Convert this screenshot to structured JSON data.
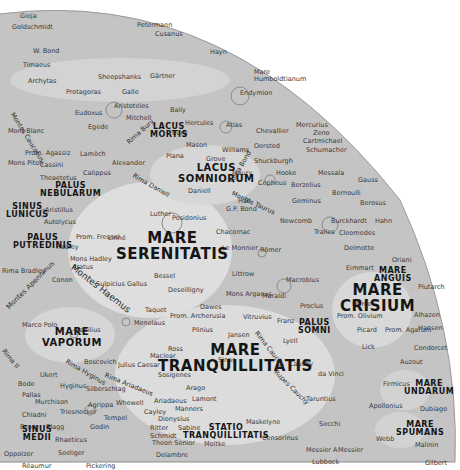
{
  "map": {
    "background": "#ffffff",
    "surface_color": "#c9c9c9",
    "mare_color": "#dcdcdc",
    "maria": [
      {
        "id": "lacus-mortis",
        "lines": [
          "LACUS",
          "MORTIS"
        ],
        "x": 150,
        "y": 123,
        "size": "m-sm"
      },
      {
        "id": "lacus-somniorum",
        "lines": [
          "LACUS",
          "SOMNIORUM"
        ],
        "x": 178,
        "y": 163,
        "size": "m-md"
      },
      {
        "id": "palus-nebularum",
        "lines": [
          "PALUS",
          "NEBULARUM"
        ],
        "x": 40,
        "y": 182,
        "size": "m-sm"
      },
      {
        "id": "sinus-lunicus",
        "lines": [
          "SINUS",
          "LUNICUS"
        ],
        "x": 6,
        "y": 203,
        "size": "m-sm"
      },
      {
        "id": "palus-putredinis",
        "lines": [
          "PALUS",
          "PUTREDINIS"
        ],
        "x": 13,
        "y": 234,
        "size": "m-sm"
      },
      {
        "id": "mare-serenitatis",
        "lines": [
          "MARE",
          "SERENITATIS"
        ],
        "x": 116,
        "y": 231,
        "size": "m-lg"
      },
      {
        "id": "mare-vaporum",
        "lines": [
          "MARE",
          "VAPORUM"
        ],
        "x": 42,
        "y": 327,
        "size": "m-md"
      },
      {
        "id": "mare-tranquillitatis",
        "lines": [
          "MARE",
          "TRANQUILLITATIS"
        ],
        "x": 158,
        "y": 343,
        "size": "m-lg"
      },
      {
        "id": "palus-somni",
        "lines": [
          "PALUS",
          "SOMNI"
        ],
        "x": 298,
        "y": 319,
        "size": "m-sm"
      },
      {
        "id": "mare-crisium",
        "lines": [
          "MARE",
          "CRISIUM"
        ],
        "x": 340,
        "y": 283,
        "size": "m-lg"
      },
      {
        "id": "mare-anguis",
        "lines": [
          "MARE",
          "ANGUIS"
        ],
        "x": 374,
        "y": 267,
        "size": "m-sm"
      },
      {
        "id": "mare-undarum",
        "lines": [
          "MARE",
          "UNDARUM"
        ],
        "x": 404,
        "y": 380,
        "size": "m-sm"
      },
      {
        "id": "mare-spumans",
        "lines": [
          "MARE",
          "SPUMANS"
        ],
        "x": 396,
        "y": 421,
        "size": "m-sm"
      },
      {
        "id": "statio-tranquillitatis",
        "lines": [
          "STATIO",
          "TRANQUILLITATIS"
        ],
        "x": 183,
        "y": 424,
        "size": "m-sm"
      },
      {
        "id": "sinus-medii",
        "lines": [
          "SINUS",
          "MEDII"
        ],
        "x": 22,
        "y": 426,
        "size": "m-sm"
      },
      {
        "id": "mare-humboldtianum",
        "lines": [
          "Mare",
          "Humboldtianum"
        ],
        "x": 254,
        "y": 69,
        "size": "plain"
      }
    ],
    "rotated_features": [
      {
        "id": "montes-haemus",
        "text": "Montes Haemus",
        "x": 72,
        "y": 262,
        "angle": 38,
        "size": 9
      },
      {
        "id": "montes-apenninus",
        "text": "Montes Apenninus",
        "x": 8,
        "y": 305,
        "angle": -45,
        "size": 7
      },
      {
        "id": "montes-caucasus",
        "text": "Montes Caucasus",
        "x": 12,
        "y": 110,
        "angle": 58,
        "size": 6.5
      },
      {
        "id": "rima-bury",
        "text": "Rima Bury",
        "x": 128,
        "y": 140,
        "angle": -42,
        "size": 6.5
      },
      {
        "id": "rima-daniell",
        "text": "Rima Daniell",
        "x": 133,
        "y": 172,
        "angle": 30,
        "size": 6.5
      },
      {
        "id": "rima-hyginus",
        "text": "Rima Hyginus",
        "x": 66,
        "y": 358,
        "angle": 30,
        "size": 6.5
      },
      {
        "id": "rima-ariadaeus",
        "text": "Rima Ariadaeus",
        "x": 105,
        "y": 372,
        "angle": 22,
        "size": 6.5
      },
      {
        "id": "rima-cauchy",
        "text": "Rima Cauchy",
        "x": 256,
        "y": 329,
        "angle": 52,
        "size": 6.5
      },
      {
        "id": "rupes-cauchy",
        "text": "Rupes Cauchy",
        "x": 275,
        "y": 368,
        "angle": 45,
        "size": 6.5
      },
      {
        "id": "montes-taurus",
        "text": "Montes Taurus",
        "x": 232,
        "y": 190,
        "angle": 25,
        "size": 6.5
      },
      {
        "id": "rima-bond",
        "text": "Rima Bond",
        "x": 232,
        "y": 179,
        "angle": -60,
        "size": 6.5
      },
      {
        "id": "rima-ii",
        "text": "Rima II",
        "x": 3,
        "y": 347,
        "angle": 50,
        "size": 6.5
      }
    ],
    "craters": [
      {
        "name": "Gioja",
        "x": 20,
        "y": 13
      },
      {
        "name": "Goldschmidt",
        "x": 12,
        "y": 24
      },
      {
        "name": "Petermann",
        "x": 137,
        "y": 22
      },
      {
        "name": "Cusanus",
        "x": 155,
        "y": 31
      },
      {
        "name": "Hayn",
        "x": 210,
        "y": 49
      },
      {
        "name": "Endymion",
        "x": 240,
        "y": 90
      },
      {
        "name": "W. Bond",
        "x": 33,
        "y": 48
      },
      {
        "name": "Timaeus",
        "x": 23,
        "y": 62
      },
      {
        "name": "Archytas",
        "x": 28,
        "y": 78
      },
      {
        "name": "Sheepshanks",
        "x": 98,
        "y": 74
      },
      {
        "name": "Gärtner",
        "x": 150,
        "y": 73
      },
      {
        "name": "Protagoras",
        "x": 66,
        "y": 89
      },
      {
        "name": "Galle",
        "x": 122,
        "y": 89
      },
      {
        "name": "Aristoteles",
        "x": 114,
        "y": 103
      },
      {
        "name": "Mitchell",
        "x": 126,
        "y": 115
      },
      {
        "name": "Egede",
        "x": 88,
        "y": 124
      },
      {
        "name": "Eudoxus",
        "x": 75,
        "y": 110
      },
      {
        "name": "Baily",
        "x": 170,
        "y": 107
      },
      {
        "name": "Mont Blanc",
        "x": 8,
        "y": 128
      },
      {
        "name": "Prom. Agassiz",
        "x": 25,
        "y": 150
      },
      {
        "name": "Cassini",
        "x": 40,
        "y": 162
      },
      {
        "name": "Mons Piton",
        "x": 8,
        "y": 160
      },
      {
        "name": "Theaetetus",
        "x": 40,
        "y": 175
      },
      {
        "name": "Lamèch",
        "x": 80,
        "y": 151
      },
      {
        "name": "Calippus",
        "x": 83,
        "y": 170
      },
      {
        "name": "Alexander",
        "x": 112,
        "y": 160
      },
      {
        "name": "Aristillus",
        "x": 45,
        "y": 207
      },
      {
        "name": "Autolycus",
        "x": 44,
        "y": 219
      },
      {
        "name": "Bürg",
        "x": 172,
        "y": 130
      },
      {
        "name": "Plana",
        "x": 166,
        "y": 153
      },
      {
        "name": "Mason",
        "x": 186,
        "y": 142
      },
      {
        "name": "Hercules",
        "x": 185,
        "y": 120
      },
      {
        "name": "Atlas",
        "x": 226,
        "y": 122
      },
      {
        "name": "Chevallier",
        "x": 256,
        "y": 128
      },
      {
        "name": "Williams",
        "x": 222,
        "y": 147
      },
      {
        "name": "Grove",
        "x": 206,
        "y": 156
      },
      {
        "name": "Oersted",
        "x": 254,
        "y": 143
      },
      {
        "name": "Mercurius",
        "x": 296,
        "y": 122
      },
      {
        "name": "Zeno",
        "x": 313,
        "y": 130
      },
      {
        "name": "Cartmichael",
        "x": 303,
        "y": 138
      },
      {
        "name": "Schumacher",
        "x": 306,
        "y": 147
      },
      {
        "name": "Shuckburgh",
        "x": 254,
        "y": 158
      },
      {
        "name": "Hooke",
        "x": 276,
        "y": 170
      },
      {
        "name": "Messala",
        "x": 318,
        "y": 170
      },
      {
        "name": "Gauss",
        "x": 358,
        "y": 177
      },
      {
        "name": "Maury",
        "x": 232,
        "y": 170
      },
      {
        "name": "Cepheus",
        "x": 258,
        "y": 180
      },
      {
        "name": "Berzelius",
        "x": 291,
        "y": 182
      },
      {
        "name": "Bernoulli",
        "x": 332,
        "y": 190
      },
      {
        "name": "Geminus",
        "x": 292,
        "y": 198
      },
      {
        "name": "Berosus",
        "x": 360,
        "y": 200
      },
      {
        "name": "Daniell",
        "x": 188,
        "y": 188
      },
      {
        "name": "Hall",
        "x": 238,
        "y": 198
      },
      {
        "name": "G.P. Bond",
        "x": 226,
        "y": 206
      },
      {
        "name": "Posidonius",
        "x": 172,
        "y": 215
      },
      {
        "name": "Luther",
        "x": 150,
        "y": 211
      },
      {
        "name": "Newcomb",
        "x": 280,
        "y": 218
      },
      {
        "name": "Burckhardt",
        "x": 331,
        "y": 218
      },
      {
        "name": "Hahn",
        "x": 375,
        "y": 218
      },
      {
        "name": "Chacornac",
        "x": 216,
        "y": 229
      },
      {
        "name": "Cleomedes",
        "x": 339,
        "y": 230
      },
      {
        "name": "Tralles",
        "x": 314,
        "y": 229
      },
      {
        "name": "Delmotte",
        "x": 344,
        "y": 245
      },
      {
        "name": "Römer",
        "x": 260,
        "y": 247
      },
      {
        "name": "Le Monnier",
        "x": 222,
        "y": 245
      },
      {
        "name": "Littrow",
        "x": 232,
        "y": 271
      },
      {
        "name": "Maraldi",
        "x": 262,
        "y": 293
      },
      {
        "name": "Macrobius",
        "x": 286,
        "y": 277
      },
      {
        "name": "Proclus",
        "x": 300,
        "y": 303
      },
      {
        "name": "Eimmart",
        "x": 346,
        "y": 265
      },
      {
        "name": "Oriani",
        "x": 392,
        "y": 257
      },
      {
        "name": "Plutarch",
        "x": 418,
        "y": 284
      },
      {
        "name": "Peirce",
        "x": 352,
        "y": 301
      },
      {
        "name": "Prom. Olivium",
        "x": 337,
        "y": 313
      },
      {
        "name": "Picard",
        "x": 357,
        "y": 327
      },
      {
        "name": "Prom. Agarum",
        "x": 385,
        "y": 327
      },
      {
        "name": "Alhazen",
        "x": 414,
        "y": 312
      },
      {
        "name": "Hansen",
        "x": 418,
        "y": 325
      },
      {
        "name": "Lick",
        "x": 362,
        "y": 344
      },
      {
        "name": "Condorcet",
        "x": 414,
        "y": 345
      },
      {
        "name": "Auzout",
        "x": 400,
        "y": 359
      },
      {
        "name": "Firmicus",
        "x": 383,
        "y": 381
      },
      {
        "name": "Apollonius",
        "x": 369,
        "y": 403
      },
      {
        "name": "Dubiago",
        "x": 420,
        "y": 406
      },
      {
        "name": "Webb",
        "x": 376,
        "y": 436
      },
      {
        "name": "Messier A",
        "x": 306,
        "y": 447
      },
      {
        "name": "Messier",
        "x": 338,
        "y": 447
      },
      {
        "name": "Lubbock",
        "x": 312,
        "y": 459
      },
      {
        "name": "Gilbert",
        "x": 425,
        "y": 460
      },
      {
        "name": "Malinin",
        "x": 415,
        "y": 442
      },
      {
        "name": "Taruntius",
        "x": 306,
        "y": 396
      },
      {
        "name": "Secchi",
        "x": 319,
        "y": 421
      },
      {
        "name": "da Vinci",
        "x": 318,
        "y": 371
      },
      {
        "name": "Cauchy",
        "x": 289,
        "y": 361
      },
      {
        "name": "Lyell",
        "x": 283,
        "y": 338
      },
      {
        "name": "Franz",
        "x": 277,
        "y": 318
      },
      {
        "name": "Jansen",
        "x": 228,
        "y": 332
      },
      {
        "name": "Vitruvius",
        "x": 243,
        "y": 314
      },
      {
        "name": "Mons Argaeus",
        "x": 226,
        "y": 291
      },
      {
        "name": "Dawes",
        "x": 200,
        "y": 304
      },
      {
        "name": "Plinius",
        "x": 192,
        "y": 327
      },
      {
        "name": "Prom. Archerusia",
        "x": 170,
        "y": 313
      },
      {
        "name": "Taquet",
        "x": 145,
        "y": 307
      },
      {
        "name": "Menelaus",
        "x": 134,
        "y": 320
      },
      {
        "name": "Deseilligny",
        "x": 168,
        "y": 287
      },
      {
        "name": "Bessel",
        "x": 154,
        "y": 273
      },
      {
        "name": "Sulpicius Gallus",
        "x": 96,
        "y": 281
      },
      {
        "name": "Linné",
        "x": 108,
        "y": 235
      },
      {
        "name": "Mons Hadley",
        "x": 70,
        "y": 256
      },
      {
        "name": "Hadley",
        "x": 56,
        "y": 244
      },
      {
        "name": "Prom. Fresnel",
        "x": 76,
        "y": 234
      },
      {
        "name": "Conon",
        "x": 52,
        "y": 277
      },
      {
        "name": "Aratus",
        "x": 72,
        "y": 264
      },
      {
        "name": "Rima Bradley",
        "x": 2,
        "y": 268
      },
      {
        "name": "Marco Polo",
        "x": 22,
        "y": 322
      },
      {
        "name": "Manilius",
        "x": 74,
        "y": 327
      },
      {
        "name": "Boscovich",
        "x": 84,
        "y": 359
      },
      {
        "name": "Julius Caesar",
        "x": 118,
        "y": 362
      },
      {
        "name": "Ross",
        "x": 168,
        "y": 346
      },
      {
        "name": "Maclear",
        "x": 150,
        "y": 353
      },
      {
        "name": "Sinas",
        "x": 218,
        "y": 357
      },
      {
        "name": "Sosigenes",
        "x": 158,
        "y": 372
      },
      {
        "name": "Arago",
        "x": 186,
        "y": 385
      },
      {
        "name": "Lamont",
        "x": 192,
        "y": 396
      },
      {
        "name": "Ariadaeus",
        "x": 154,
        "y": 398
      },
      {
        "name": "Manners",
        "x": 175,
        "y": 406
      },
      {
        "name": "Dionysius",
        "x": 158,
        "y": 416
      },
      {
        "name": "Ritter",
        "x": 150,
        "y": 425
      },
      {
        "name": "Sabine",
        "x": 178,
        "y": 425
      },
      {
        "name": "Schmidt",
        "x": 150,
        "y": 433
      },
      {
        "name": "Moltke",
        "x": 204,
        "y": 441
      },
      {
        "name": "Theon Senior",
        "x": 152,
        "y": 440
      },
      {
        "name": "Delambre",
        "x": 156,
        "y": 452
      },
      {
        "name": "Maskelyne",
        "x": 246,
        "y": 419
      },
      {
        "name": "Censorinus",
        "x": 262,
        "y": 435
      },
      {
        "name": "Ukert",
        "x": 40,
        "y": 372
      },
      {
        "name": "Hyginus",
        "x": 60,
        "y": 383
      },
      {
        "name": "Bode",
        "x": 18,
        "y": 381
      },
      {
        "name": "Pallas",
        "x": 22,
        "y": 392
      },
      {
        "name": "Murchison",
        "x": 35,
        "y": 399
      },
      {
        "name": "Silberschlag",
        "x": 86,
        "y": 386
      },
      {
        "name": "Triesnecker",
        "x": 60,
        "y": 409
      },
      {
        "name": "Agrippa",
        "x": 88,
        "y": 402
      },
      {
        "name": "Whewell",
        "x": 116,
        "y": 400
      },
      {
        "name": "Cayley",
        "x": 144,
        "y": 409
      },
      {
        "name": "Tempel",
        "x": 104,
        "y": 415
      },
      {
        "name": "Godin",
        "x": 90,
        "y": 424
      },
      {
        "name": "Chladni",
        "x": 22,
        "y": 412
      },
      {
        "name": "Bruce",
        "x": 20,
        "y": 424
      },
      {
        "name": "Blagg",
        "x": 46,
        "y": 424
      },
      {
        "name": "Rhaeticus",
        "x": 55,
        "y": 437
      },
      {
        "name": "Oppolzer",
        "x": 4,
        "y": 451
      },
      {
        "name": "Seeliger",
        "x": 58,
        "y": 450
      },
      {
        "name": "Réaumur",
        "x": 22,
        "y": 463
      },
      {
        "name": "Pickering",
        "x": 86,
        "y": 463
      }
    ]
  }
}
